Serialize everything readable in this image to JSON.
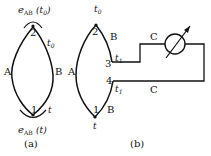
{
  "figure_a": {
    "caption": "(a)",
    "node_top": "2",
    "node_bottom": "1",
    "wire_left": "A",
    "wire_right": "B",
    "temp_top": "t0",
    "temp_bottom": "t",
    "emf_top": {
      "symbol": "e",
      "sub": "AB",
      "arg": "(t0)"
    },
    "emf_bottom": {
      "symbol": "e",
      "sub": "AB",
      "arg": "(t)"
    }
  },
  "figure_b": {
    "caption": "(b)",
    "node_top": "2",
    "node_bottom": "1",
    "node_3": "3",
    "node_4": "4",
    "wire_left": "A",
    "wire_right_top": "B",
    "wire_right_bottom": "B",
    "temp_top": "t0",
    "temp_bottom": "t",
    "temp_3": "t1",
    "temp_4": "t1",
    "wire_c_top": "C",
    "wire_c_bottom": "C",
    "meter": "galvanometer-icon"
  }
}
